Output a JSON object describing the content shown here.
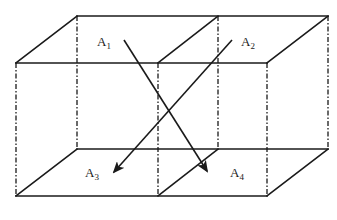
{
  "diagram": {
    "type": "3d-box-partition",
    "labels": [
      {
        "id": "A1",
        "base": "A",
        "sub": "1",
        "face": "top",
        "cell": "left"
      },
      {
        "id": "A2",
        "base": "A",
        "sub": "2",
        "face": "top",
        "cell": "right"
      },
      {
        "id": "A3",
        "base": "A",
        "sub": "3",
        "face": "bottom",
        "cell": "left"
      },
      {
        "id": "A4",
        "base": "A",
        "sub": "4",
        "face": "bottom",
        "cell": "right"
      }
    ],
    "arrows": [
      {
        "from": "A1",
        "to": "A4"
      },
      {
        "from": "A2",
        "to": "A3"
      }
    ],
    "line_styles": {
      "visible_edges": "solid",
      "hidden_edges": "dash-dot"
    },
    "colors": {
      "stroke": "#1a1a1a",
      "background": "#ffffff"
    }
  }
}
